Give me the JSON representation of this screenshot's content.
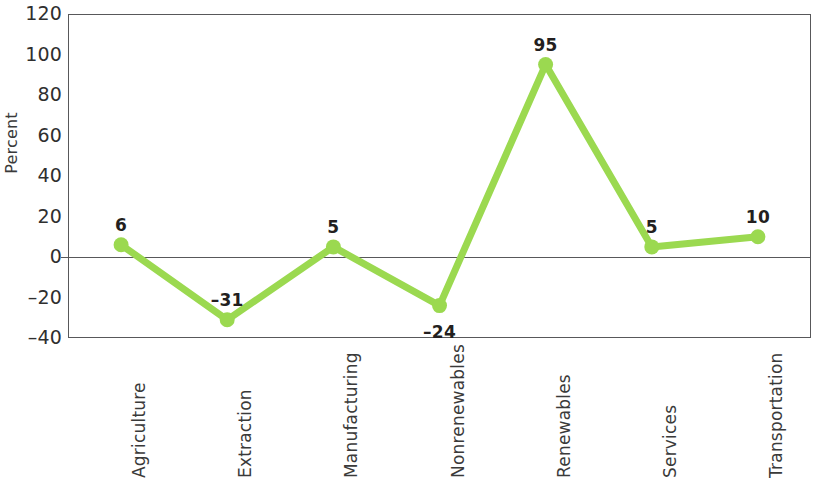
{
  "chart_data": {
    "type": "line",
    "title": "",
    "subtitle": "",
    "xlabel": "",
    "ylabel": "Percent",
    "categories": [
      "Agriculture",
      "Extraction",
      "Manufacturing",
      "Nonrenewables",
      "Renewables",
      "Services",
      "Transportation"
    ],
    "values": [
      6,
      -31,
      5,
      -24,
      95,
      5,
      10
    ],
    "point_labels": [
      "6",
      "–31",
      "5",
      "–24",
      "95",
      "5",
      "10"
    ],
    "label_position": [
      "above",
      "above",
      "above",
      "below",
      "above",
      "above",
      "above"
    ],
    "ylim": [
      -40,
      120
    ],
    "y_ticks": [
      120,
      100,
      80,
      60,
      40,
      20,
      0,
      -20,
      -40
    ],
    "y_tick_labels": [
      "120",
      "100",
      "80",
      "60",
      "40",
      "20",
      "0",
      "–20",
      "–40"
    ],
    "grid": false,
    "legend": "none",
    "zero_line": 0,
    "series_color": "#9bd950",
    "marker": "circle",
    "axis_color": "#58585a",
    "text_color": "#231f20"
  }
}
